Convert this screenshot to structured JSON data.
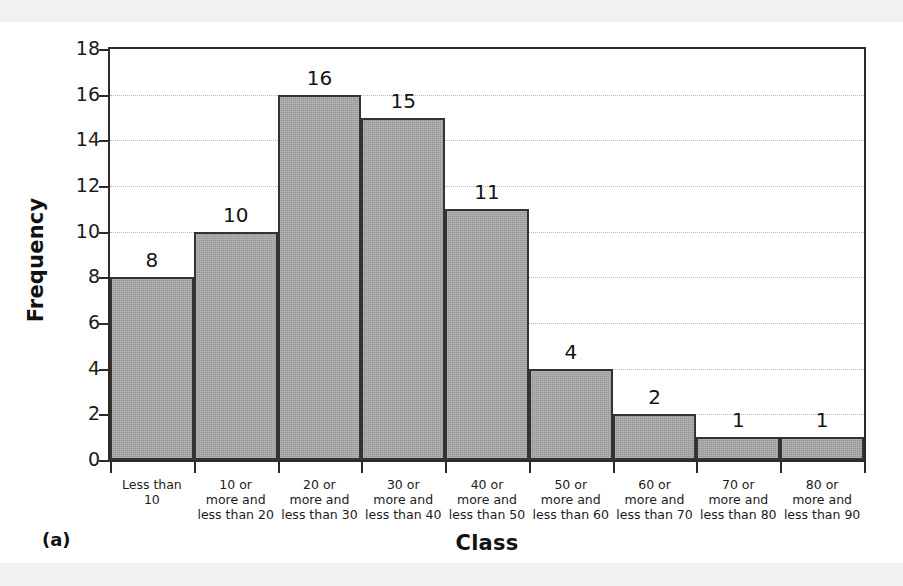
{
  "figure": {
    "caption": "(a)"
  },
  "chart_data": {
    "type": "bar",
    "title": "",
    "subtitle": "",
    "xlabel": "Class",
    "ylabel": "Frequency",
    "ylim": [
      0,
      18
    ],
    "ytick_step": 2,
    "yticks": [
      "0",
      "2",
      "4",
      "6",
      "8",
      "10",
      "12",
      "14",
      "16",
      "18"
    ],
    "grid": "horizontal-dotted",
    "legend": "none",
    "bar_fill_color": "#a6a6a6",
    "bar_border_color": "#333333",
    "gridline_color": "#b9b9b9",
    "axis_color": "#2b2b2b",
    "categories": [
      "Less than\n10",
      "10 or\nmore and\nless than 20",
      "20 or\nmore and\nless than 30",
      "30 or\nmore and\nless than 40",
      "40 or\nmore and\nless than 50",
      "50 or\nmore and\nless than 60",
      "60 or\nmore and\nless than 70",
      "70 or\nmore and\nless than 80",
      "80 or\nmore and\nless than 90"
    ],
    "category_lines": [
      [
        "Less than",
        "10"
      ],
      [
        "10 or",
        "more and",
        "less than 20"
      ],
      [
        "20 or",
        "more and",
        "less than 30"
      ],
      [
        "30 or",
        "more and",
        "less than 40"
      ],
      [
        "40 or",
        "more and",
        "less than 50"
      ],
      [
        "50 or",
        "more and",
        "less than 60"
      ],
      [
        "60 or",
        "more and",
        "less than 70"
      ],
      [
        "70 or",
        "more and",
        "less than 80"
      ],
      [
        "80 or",
        "more and",
        "less than 90"
      ]
    ],
    "values": [
      8,
      10,
      16,
      15,
      11,
      4,
      2,
      1,
      1
    ],
    "data_labels": [
      "8",
      "10",
      "16",
      "15",
      "11",
      "4",
      "2",
      "1",
      "1"
    ]
  }
}
